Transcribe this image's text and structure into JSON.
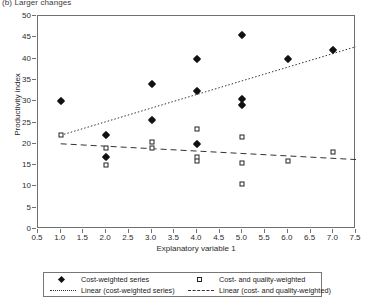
{
  "caption": "(b) Larger changes",
  "chart_data": {
    "type": "scatter",
    "title": "(b) Larger changes",
    "xlabel": "Explanatory variable 1",
    "ylabel": "Productivity index",
    "xlim": [
      0.5,
      7.5
    ],
    "ylim": [
      0,
      50
    ],
    "xticks": [
      "0.5",
      "1.0",
      "1.5",
      "2.0",
      "2.5",
      "3.0",
      "3.5",
      "4.0",
      "4.5",
      "5.0",
      "5.5",
      "6.0",
      "6.5",
      "7.0",
      "7.5"
    ],
    "xtick_values": [
      0.5,
      1.0,
      1.5,
      2.0,
      2.5,
      3.0,
      3.5,
      4.0,
      4.5,
      5.0,
      5.5,
      6.0,
      6.5,
      7.0,
      7.5
    ],
    "yticks": [
      "0",
      "5",
      "10",
      "15",
      "20",
      "25",
      "30",
      "35",
      "40",
      "45",
      "50"
    ],
    "ytick_values": [
      0,
      5,
      10,
      15,
      20,
      25,
      30,
      35,
      40,
      45,
      50
    ],
    "grid": false,
    "legend_position": "below",
    "series": [
      {
        "name": "Cost-weighted series",
        "marker": "filled-diamond",
        "color": "#111111",
        "points": [
          {
            "x": 1.0,
            "y": 30.0
          },
          {
            "x": 2.0,
            "y": 22.0
          },
          {
            "x": 2.0,
            "y": 17.0
          },
          {
            "x": 3.0,
            "y": 34.0
          },
          {
            "x": 3.0,
            "y": 25.5
          },
          {
            "x": 4.0,
            "y": 40.0
          },
          {
            "x": 4.0,
            "y": 32.5
          },
          {
            "x": 4.0,
            "y": 20.0
          },
          {
            "x": 5.0,
            "y": 45.5
          },
          {
            "x": 5.0,
            "y": 30.5
          },
          {
            "x": 5.0,
            "y": 29.0
          },
          {
            "x": 6.0,
            "y": 40.0
          },
          {
            "x": 7.0,
            "y": 42.0
          }
        ]
      },
      {
        "name": "Cost- and quality-weighted",
        "marker": "open-square",
        "color": "#222222",
        "points": [
          {
            "x": 1.0,
            "y": 22.0
          },
          {
            "x": 2.0,
            "y": 19.0
          },
          {
            "x": 2.0,
            "y": 15.0
          },
          {
            "x": 3.0,
            "y": 20.5
          },
          {
            "x": 3.0,
            "y": 19.0
          },
          {
            "x": 4.0,
            "y": 23.5
          },
          {
            "x": 4.0,
            "y": 17.0
          },
          {
            "x": 4.0,
            "y": 16.0
          },
          {
            "x": 5.0,
            "y": 21.5
          },
          {
            "x": 5.0,
            "y": 15.5
          },
          {
            "x": 5.0,
            "y": 10.5
          },
          {
            "x": 6.0,
            "y": 16.0
          },
          {
            "x": 7.0,
            "y": 18.0
          }
        ]
      }
    ],
    "trendlines": [
      {
        "name": "Linear (cost-weighted series)",
        "style": "dotted",
        "color": "#333333",
        "x1": 1.0,
        "y1": 22.0,
        "x2": 7.5,
        "y2": 42.8
      },
      {
        "name": "Linear (cost- and quality-weighted)",
        "style": "dashed",
        "color": "#333333",
        "x1": 1.0,
        "y1": 20.0,
        "x2": 7.5,
        "y2": 16.3
      }
    ],
    "legend": [
      {
        "label": "Cost-weighted series",
        "key": "filled-diamond"
      },
      {
        "label": "Cost- and quality-weighted",
        "key": "open-square"
      },
      {
        "label": "Linear (cost-weighted series)",
        "key": "dotted-line"
      },
      {
        "label": "Linear (cost- and quality-weighted)",
        "key": "dashed-line"
      }
    ]
  }
}
